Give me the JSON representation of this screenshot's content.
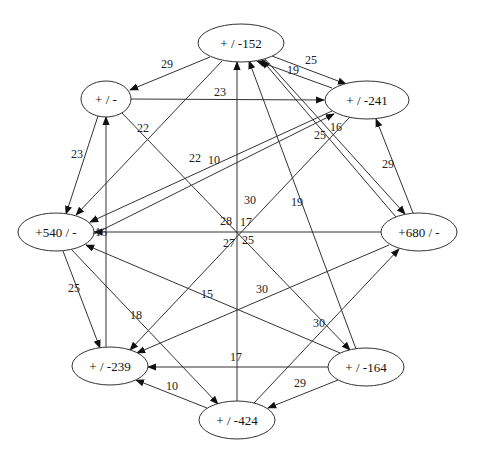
{
  "diagram": {
    "type": "directed-graph",
    "nodes": [
      {
        "id": "n152",
        "label": "+ / -152",
        "cx": 241,
        "cy": 43,
        "rx": 43,
        "ry": 19
      },
      {
        "id": "n241",
        "label": "+ / -241",
        "cx": 367,
        "cy": 100,
        "rx": 42,
        "ry": 19
      },
      {
        "id": "n680",
        "label": "+680 / -",
        "cx": 419,
        "cy": 232,
        "rx": 38,
        "ry": 19
      },
      {
        "id": "n164",
        "label": "+ / -164",
        "cx": 366,
        "cy": 367,
        "rx": 38,
        "ry": 19
      },
      {
        "id": "n424",
        "label": "+ / -424",
        "cx": 237,
        "cy": 420,
        "rx": 38,
        "ry": 19
      },
      {
        "id": "n239",
        "label": "+ / -239",
        "cx": 110,
        "cy": 366,
        "rx": 38,
        "ry": 19
      },
      {
        "id": "n540",
        "label": "+540 / -",
        "cx": 56,
        "cy": 232,
        "rx": 38,
        "ry": 19
      },
      {
        "id": "nblank",
        "label": "+ / -",
        "cx": 106,
        "cy": 99,
        "rx": 25,
        "ry": 18
      }
    ],
    "edges": [
      {
        "from": "n152",
        "to": "nblank",
        "label": "29",
        "x1": 210,
        "y1": 57,
        "x2": 130,
        "y2": 90,
        "lx": 167,
        "ly": 64
      },
      {
        "from": "n152",
        "to": "n241",
        "label": "25",
        "x1": 272,
        "y1": 56,
        "x2": 346,
        "y2": 84,
        "lx": 311,
        "ly": 60
      },
      {
        "from": "n241",
        "to": "n152",
        "label": "19",
        "x1": 332,
        "y1": 88,
        "x2": 257,
        "y2": 61,
        "lx": 293,
        "ly": 70
      },
      {
        "from": "nblank",
        "to": "n241",
        "label": "23",
        "x1": 131,
        "y1": 99,
        "x2": 324,
        "y2": 100,
        "lx": 220,
        "ly": 92
      },
      {
        "from": "n152",
        "to": "n540",
        "label": "22",
        "x1": 222,
        "y1": 61,
        "x2": 76,
        "y2": 215,
        "lx": 143,
        "ly": 128
      },
      {
        "from": "nblank",
        "to": "n164",
        "label": "22",
        "x1": 122,
        "y1": 113,
        "x2": 350,
        "y2": 350,
        "lx": 145,
        "ly": 128
      },
      {
        "from": "nblank",
        "to": "n540",
        "label": "23",
        "x1": 98,
        "y1": 116,
        "x2": 66,
        "y2": 214,
        "lx": 77,
        "ly": 154
      },
      {
        "from": "n241",
        "to": "n540",
        "label": "22",
        "x1": 332,
        "y1": 111,
        "x2": 90,
        "y2": 222,
        "lx": 195,
        "ly": 158
      },
      {
        "from": "n540",
        "to": "n241",
        "label": "10",
        "x1": 88,
        "y1": 237,
        "x2": 334,
        "y2": 114,
        "lx": 214,
        "ly": 160
      },
      {
        "from": "n241",
        "to": "n239",
        "label": "16",
        "x1": 350,
        "y1": 117,
        "x2": 130,
        "y2": 350,
        "lx": 336,
        "ly": 127
      },
      {
        "from": "n680",
        "to": "n152",
        "label": "25",
        "x1": 396,
        "y1": 217,
        "x2": 262,
        "y2": 60,
        "lx": 320,
        "ly": 135
      },
      {
        "from": "n680",
        "to": "n241",
        "label": "29",
        "x1": 413,
        "y1": 213,
        "x2": 376,
        "y2": 119,
        "lx": 388,
        "ly": 164
      },
      {
        "from": "n152",
        "to": "n680",
        "label": "",
        "x1": 264,
        "y1": 58,
        "x2": 405,
        "y2": 214,
        "lx": 0,
        "ly": 0
      },
      {
        "from": "n680",
        "to": "n540",
        "label": "16",
        "x1": 381,
        "y1": 232,
        "x2": 94,
        "y2": 232,
        "lx": 101,
        "ly": 232
      },
      {
        "from": "n424",
        "to": "n152",
        "label": "17",
        "x1": 237,
        "y1": 401,
        "x2": 237,
        "y2": 62,
        "lx": 246,
        "ly": 222
      },
      {
        "from": "nblank",
        "to": "n164",
        "label": "28",
        "x1": 220,
        "y1": 217,
        "x2": 220,
        "y2": 217,
        "lx": 226,
        "ly": 221
      },
      {
        "from": "n164",
        "to": "n152",
        "label": "19",
        "x1": 356,
        "y1": 349,
        "x2": 249,
        "y2": 61,
        "lx": 297,
        "ly": 202
      },
      {
        "from": "n239",
        "to": "nblank",
        "label": "",
        "x1": 106,
        "y1": 347,
        "x2": 106,
        "y2": 117,
        "lx": 0,
        "ly": 0
      },
      {
        "from": "n540",
        "to": "n239",
        "label": "25",
        "x1": 63,
        "y1": 251,
        "x2": 100,
        "y2": 348,
        "lx": 74,
        "ly": 288
      },
      {
        "from": "n540",
        "to": "n424",
        "label": "18",
        "x1": 71,
        "y1": 249,
        "x2": 218,
        "y2": 404,
        "lx": 136,
        "ly": 315
      },
      {
        "from": "n164",
        "to": "n540",
        "label": "15",
        "x1": 340,
        "y1": 353,
        "x2": 86,
        "y2": 245,
        "lx": 207,
        "ly": 294
      },
      {
        "from": "n680",
        "to": "n239",
        "label": "30",
        "x1": 389,
        "y1": 245,
        "x2": 137,
        "y2": 353,
        "lx": 262,
        "ly": 289
      },
      {
        "from": "n241",
        "to": "n239",
        "label": "27",
        "x1": 0,
        "y1": 0,
        "x2": 0,
        "y2": 0,
        "lx": 229,
        "ly": 243
      },
      {
        "from": "nblank",
        "to": "n164",
        "label": "30",
        "x1": 0,
        "y1": 0,
        "x2": 0,
        "y2": 0,
        "lx": 319,
        "ly": 323
      },
      {
        "from": "n164",
        "to": "n239",
        "label": "17",
        "x1": 328,
        "y1": 367,
        "x2": 148,
        "y2": 367,
        "lx": 236,
        "ly": 357
      },
      {
        "from": "n424",
        "to": "n239",
        "label": "10",
        "x1": 207,
        "y1": 408,
        "x2": 136,
        "y2": 380,
        "lx": 172,
        "ly": 386
      },
      {
        "from": "n164",
        "to": "n424",
        "label": "29",
        "x1": 338,
        "y1": 380,
        "x2": 268,
        "y2": 408,
        "lx": 300,
        "ly": 383
      },
      {
        "from": "n424",
        "to": "n680",
        "label": "30",
        "x1": 254,
        "y1": 403,
        "x2": 399,
        "y2": 249,
        "lx": 250,
        "ly": 200
      },
      {
        "from": "n241",
        "to": "n424",
        "label": "17",
        "x1": 0,
        "y1": 0,
        "x2": 0,
        "y2": 0,
        "lx": 0,
        "ly": 0
      }
    ],
    "center_labels": [
      {
        "label": "28",
        "x": 227,
        "y": 221
      },
      {
        "label": "17",
        "x": 247,
        "y": 222
      },
      {
        "label": "27",
        "x": 230,
        "y": 244
      },
      {
        "label": "25",
        "x": 248,
        "y": 240
      },
      {
        "label": "19",
        "x": 297,
        "y": 202
      },
      {
        "label": "30",
        "x": 261,
        "y": 289
      },
      {
        "label": "30",
        "x": 319,
        "y": 323
      }
    ],
    "colors": {
      "stroke": "#333333",
      "fill": "#ffffff",
      "text": "#111111"
    }
  }
}
